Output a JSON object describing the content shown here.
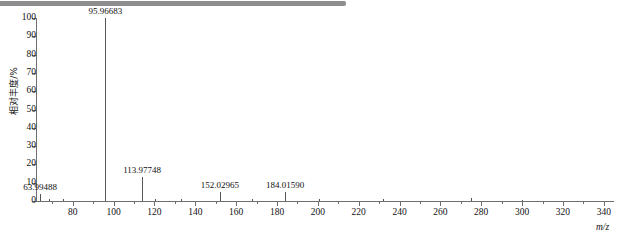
{
  "decor": {
    "top_bar_color": "#8d8d8d"
  },
  "chart_data": {
    "type": "bar",
    "title": "",
    "subtitle": "",
    "xlabel": "m/z",
    "ylabel": "相对丰度/%",
    "xlim": [
      62,
      345
    ],
    "ylim": [
      0,
      100
    ],
    "grid": false,
    "legend": null,
    "x_major_ticks": [
      80,
      100,
      120,
      140,
      160,
      180,
      200,
      220,
      240,
      260,
      280,
      300,
      320,
      340
    ],
    "x_minor_step": 10,
    "y_ticks": [
      0,
      10,
      20,
      30,
      40,
      50,
      60,
      70,
      80,
      90,
      100
    ],
    "series_name": "mass spectrum",
    "peak_color": "#555555",
    "axis_color": "#6e6e6e",
    "points": [
      {
        "mz": 63.99488,
        "intensity": 4,
        "label": "63.99488",
        "labelled": true
      },
      {
        "mz": 95.96683,
        "intensity": 100,
        "label": "95.96683",
        "labelled": true
      },
      {
        "mz": 113.97748,
        "intensity": 13,
        "label": "113.97748",
        "labelled": true
      },
      {
        "mz": 152.02965,
        "intensity": 5,
        "label": "152.02965",
        "labelled": true
      },
      {
        "mz": 184.0159,
        "intensity": 5,
        "label": "184.01590",
        "labelled": true
      },
      {
        "mz": 68.5,
        "intensity": 1.2,
        "label": "",
        "labelled": false
      },
      {
        "mz": 75.0,
        "intensity": 1.0,
        "label": "",
        "labelled": false
      },
      {
        "mz": 120.5,
        "intensity": 1.3,
        "label": "",
        "labelled": false
      },
      {
        "mz": 133.0,
        "intensity": 1.0,
        "label": "",
        "labelled": false
      },
      {
        "mz": 168.0,
        "intensity": 1.1,
        "label": "",
        "labelled": false
      },
      {
        "mz": 200.5,
        "intensity": 1.0,
        "label": "",
        "labelled": false
      },
      {
        "mz": 232.0,
        "intensity": 0.9,
        "label": "",
        "labelled": false
      },
      {
        "mz": 275.0,
        "intensity": 1.4,
        "label": "",
        "labelled": false
      },
      {
        "mz": 300.0,
        "intensity": 0.8,
        "label": "",
        "labelled": false
      }
    ]
  }
}
